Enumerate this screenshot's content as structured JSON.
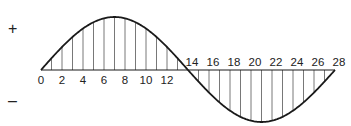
{
  "diagram": {
    "type": "sine-wave-area",
    "signs": {
      "positive": "+",
      "negative": "–"
    },
    "x_axis": {
      "labels_positive_side": [
        "0",
        "2",
        "4",
        "6",
        "8",
        "10",
        "12"
      ],
      "labels_negative_side": [
        "14",
        "16",
        "18",
        "20",
        "22",
        "24",
        "26",
        "28"
      ],
      "min": 0,
      "max": 28,
      "step": 2
    },
    "curve": {
      "description": "One full sine cycle from 0 to 28: positive half 0–14 peaking at 7, negative half 14–28 with trough at 21",
      "hatching": "vertical lines at each integer unit between curve and axis"
    },
    "colors": {
      "stroke": "#1a1a1a",
      "hatch": "#555555",
      "background": "#ffffff"
    }
  }
}
